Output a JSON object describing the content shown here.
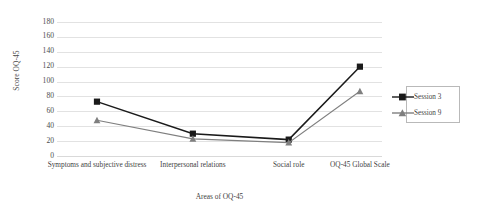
{
  "chart_data": {
    "type": "line",
    "title": "",
    "xlabel": "Areas of OQ-45",
    "ylabel": "Score  OQ-45",
    "categories": [
      "Symptoms and subjective distress",
      "Interpersonal relations",
      "Social role",
      "OQ-45 Global Scale"
    ],
    "series": [
      {
        "name": "Session 3",
        "marker": "square",
        "color": "#1a1a1a",
        "values": [
          73,
          30,
          22,
          120
        ]
      },
      {
        "name": "Session 9",
        "marker": "triangle",
        "color": "#7f7f7f",
        "values": [
          48,
          23,
          18,
          87
        ]
      }
    ],
    "ylim": [
      0,
      180
    ],
    "yticks": [
      0,
      20,
      40,
      60,
      80,
      100,
      120,
      140,
      160,
      180
    ],
    "ytick_labels": [
      "0",
      "20",
      "40",
      "60",
      "80",
      "100",
      "120",
      "140",
      "160",
      "180"
    ],
    "grid": true,
    "legend_position": "right"
  },
  "legend": {
    "entries": [
      {
        "label": "Session 3"
      },
      {
        "label": "Session 9"
      }
    ]
  },
  "colors": {
    "session3": "#1a1a1a",
    "session9": "#7f7f7f",
    "gridline": "#e2e2e2",
    "text": "#3f3f3f",
    "background": "#ffffff"
  }
}
